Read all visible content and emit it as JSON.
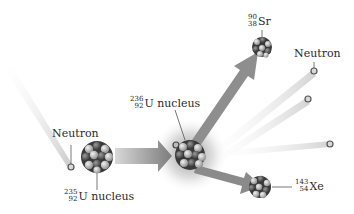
{
  "diagram": {
    "labels": {
      "incoming_neutron": "Neutron",
      "u235": {
        "mass": "235",
        "atomic": "92",
        "symbol": "U",
        "suffix": "nucleus"
      },
      "u236": {
        "mass": "236",
        "atomic": "92",
        "symbol": "U",
        "suffix": "nucleus"
      },
      "sr90": {
        "mass": "90",
        "atomic": "38",
        "symbol": "Sr"
      },
      "xe143": {
        "mass": "143",
        "atomic": "54",
        "symbol": "Xe"
      },
      "outgoing_neutron": "Neutron"
    },
    "colors": {
      "arrow": "#8a8a8a",
      "beam": "#c8c8c8",
      "nucleon_dark": "#3a3a3a",
      "nucleon_light": "#b8b8b8",
      "glow": "#9a9a9a"
    }
  }
}
